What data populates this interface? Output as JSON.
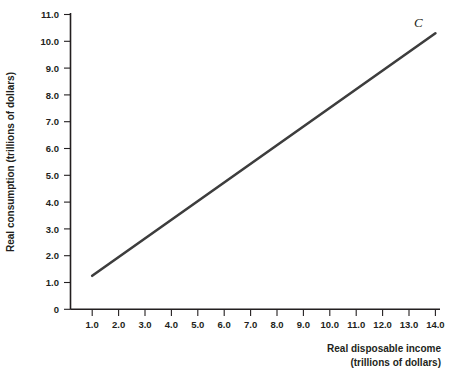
{
  "chart_data": {
    "type": "line",
    "title": "",
    "subtitle": "",
    "xlabel": "Real disposable income",
    "xlabel_sub": "(trillions of dollars)",
    "ylabel": "Real consumption (trillions of dollars)",
    "xlim": [
      0,
      14.6
    ],
    "ylim": [
      0,
      11.0
    ],
    "grid": false,
    "legend_position": "none",
    "x_ticks": [
      1.0,
      2.0,
      3.0,
      4.0,
      5.0,
      6.0,
      7.0,
      8.0,
      9.0,
      10.0,
      11.0,
      12.0,
      13.0,
      14.0
    ],
    "x_tick_labels": [
      "1.0",
      "2.0",
      "3.0",
      "4.0",
      "5.0",
      "6.0",
      "7.0",
      "8.0",
      "9.0",
      "10.0",
      "11.0",
      "12.0",
      "13.0",
      "14.0"
    ],
    "y_ticks": [
      0,
      1.0,
      2.0,
      3.0,
      4.0,
      5.0,
      6.0,
      7.0,
      8.0,
      9.0,
      10.0,
      11.0
    ],
    "y_tick_labels": [
      "0",
      "1.0",
      "2.0",
      "3.0",
      "4.0",
      "5.0",
      "6.0",
      "7.0",
      "8.0",
      "9.0",
      "10.0",
      "11.0"
    ],
    "series": [
      {
        "name": "C",
        "label": "C",
        "color": "#3d3d3d",
        "x": [
          1.0,
          14.0
        ],
        "values": [
          1.25,
          10.3
        ],
        "annotation": "C",
        "annotation_x": 13.35,
        "annotation_y": 10.55
      }
    ]
  },
  "colors": {
    "line": "#3d3d3d",
    "axis": "#231f20",
    "text": "#231f20",
    "background": "#ffffff"
  }
}
